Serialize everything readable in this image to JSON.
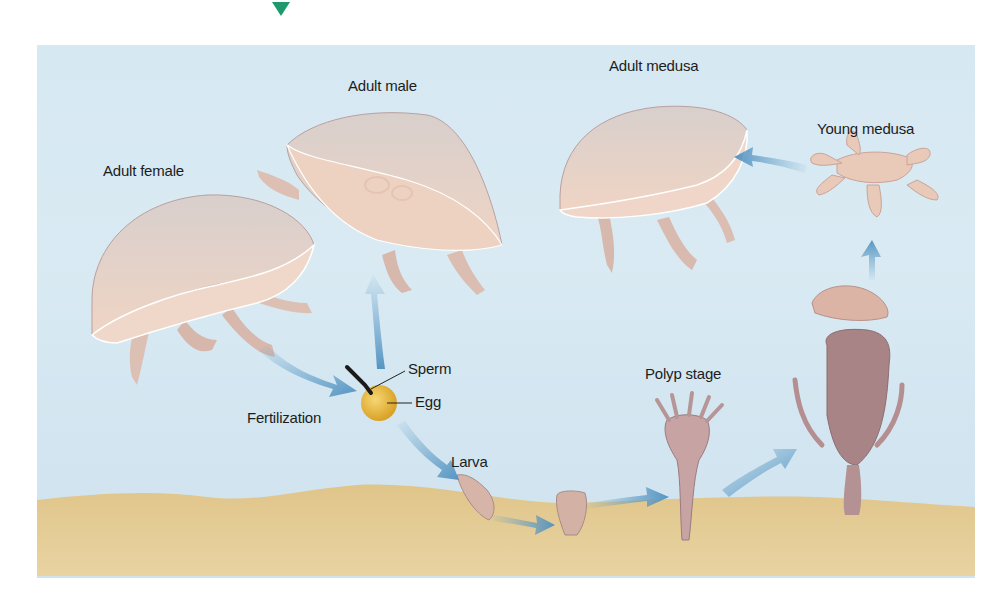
{
  "figure": {
    "marker_color": "#1d9a6c",
    "labels": {
      "adult_female": "Adult female",
      "adult_male": "Adult male",
      "adult_medusa": "Adult medusa",
      "young_medusa": "Young medusa",
      "sperm": "Sperm",
      "egg": "Egg",
      "fertilization": "Fertilization",
      "larva": "Larva",
      "polyp_stage": "Polyp stage"
    },
    "colors": {
      "water": "#d6e8f2",
      "sand": "#e3c98f",
      "medusa_body": "#ecd2c2",
      "polyp_body": "#c9a6a6",
      "strobila": "#a88688",
      "egg": "#e7b53a",
      "arrow": "#5d9cc6"
    },
    "stages": [
      "Adult female",
      "Adult male",
      "Fertilization",
      "Larva",
      "Polyp stage",
      "Young medusa",
      "Adult medusa"
    ]
  }
}
